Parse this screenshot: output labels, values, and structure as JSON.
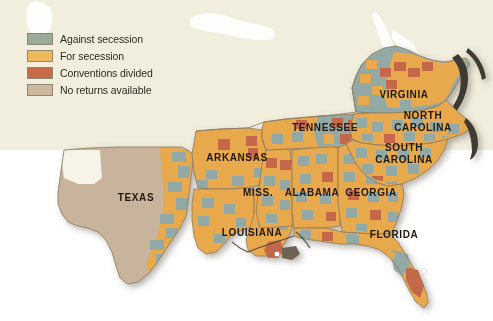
{
  "figure": {
    "background_color": "#ffffff",
    "map_background_color": "#f2eede"
  },
  "legend": {
    "name": "map-legend",
    "items": [
      {
        "label": "Against secession",
        "color": "#9bab9b"
      },
      {
        "label": "For secession",
        "color": "#eeb95c"
      },
      {
        "label": "Conventions divided",
        "color": "#c76a4a"
      },
      {
        "label": "No returns available",
        "color": "#cdb79e"
      }
    ]
  },
  "map": {
    "name": "secession-vote-map",
    "palette": {
      "against": "#93a9a6",
      "for": "#e8a94e",
      "divided": "#c4684a",
      "no_returns": "#c8b49c",
      "ocean": "#ffffff",
      "land_backdrop": "#efe9d7",
      "border": "#8a7a5e",
      "coast": "#4a4434"
    },
    "states": [
      {
        "name": "VIRGINIA",
        "label": "VIRGINIA",
        "x": 404,
        "y": 94,
        "lines": 1
      },
      {
        "name": "NORTH CAROLINA",
        "label": "NORTH\nCAROLINA",
        "x": 423,
        "y": 121,
        "lines": 2
      },
      {
        "name": "SOUTH CAROLINA",
        "label": "SOUTH\nCAROLINA",
        "x": 404,
        "y": 153,
        "lines": 2
      },
      {
        "name": "TENNESSEE",
        "label": "TENNESSEE",
        "x": 325,
        "y": 127,
        "lines": 1
      },
      {
        "name": "ARKANSAS",
        "label": "ARKANSAS",
        "x": 237,
        "y": 157,
        "lines": 1
      },
      {
        "name": "MISSISSIPPI",
        "label": "MISS.",
        "x": 258,
        "y": 192,
        "lines": 1
      },
      {
        "name": "ALABAMA",
        "label": "ALABAMA",
        "x": 312,
        "y": 192,
        "lines": 1
      },
      {
        "name": "GEORGIA",
        "label": "GEORGIA",
        "x": 371,
        "y": 192,
        "lines": 1
      },
      {
        "name": "TEXAS",
        "label": "TEXAS",
        "x": 136,
        "y": 197,
        "lines": 1
      },
      {
        "name": "LOUISIANA",
        "label": "LOUISIANA",
        "x": 252,
        "y": 232,
        "lines": 1
      },
      {
        "name": "FLORIDA",
        "label": "FLORIDA",
        "x": 394,
        "y": 234,
        "lines": 1
      }
    ],
    "city_dots": [
      {
        "name": "new-orleans-dot",
        "x": 277,
        "y": 254
      },
      {
        "name": "florida-dot",
        "x": 424,
        "y": 271
      }
    ]
  }
}
